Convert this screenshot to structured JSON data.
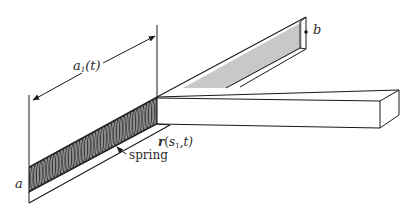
{
  "labels": {
    "a1t": {
      "main": "a",
      "sub": "1",
      "rest": "(t)"
    },
    "b": "b",
    "a": "a",
    "r": {
      "main": "r",
      "open": "(",
      "s": "s",
      "sub": "1",
      "rest": ",t)"
    },
    "spring": "spring"
  },
  "colors": {
    "stroke": "#1a1a1a",
    "spring_fill": "#3a3a3a",
    "grey_face": "#c8c8c8",
    "background": "#ffffff"
  }
}
